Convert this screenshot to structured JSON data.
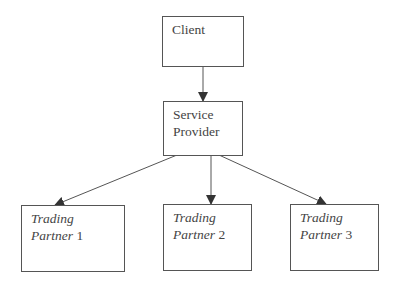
{
  "diagram": {
    "type": "hierarchy",
    "nodes": {
      "client": {
        "label": "Client"
      },
      "provider": {
        "line1": "Service",
        "line2": "Provider"
      },
      "partner1": {
        "line1": "Trading",
        "line2_word": "Partner",
        "line2_num": " 1"
      },
      "partner2": {
        "line1": "Trading",
        "line2_word": "Partner",
        "line2_num": " 2"
      },
      "partner3": {
        "line1": "Trading",
        "line2_word": "Partner",
        "line2_num": " 3"
      }
    },
    "edges": [
      {
        "from": "Client",
        "to": "Service Provider"
      },
      {
        "from": "Service Provider",
        "to": "Trading Partner 1"
      },
      {
        "from": "Service Provider",
        "to": "Trading Partner 2"
      },
      {
        "from": "Service Provider",
        "to": "Trading Partner 3"
      }
    ],
    "colors": {
      "stroke": "#555555",
      "text": "#444444",
      "background": "#ffffff"
    }
  }
}
